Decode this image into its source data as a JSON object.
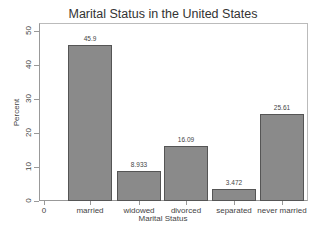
{
  "chart_data": {
    "type": "bar",
    "title": "Marital Status in the United States",
    "xlabel": "Marital Status",
    "ylabel": "Percent",
    "categories": [
      "married",
      "widowed",
      "divorced",
      "separated",
      "never married"
    ],
    "values": [
      45.9,
      8.933,
      16.09,
      3.472,
      25.61
    ],
    "value_labels": [
      "45.9",
      "8.933",
      "16.09",
      "3.472",
      "25.61"
    ],
    "ylim": [
      0,
      50
    ],
    "yticks": [
      0,
      10,
      20,
      30,
      40,
      50
    ],
    "extra_x_tick_label": "0",
    "grid": false,
    "bar_color": "#8a8a8a",
    "bar_edge_color": "#555555"
  },
  "title": "Marital Status in the United States",
  "x_axis": {
    "title": "Marital Status",
    "zero_label": "0"
  },
  "y_axis": {
    "title": "Percent",
    "ticks": [
      "0",
      "10",
      "20",
      "30",
      "40",
      "50"
    ]
  }
}
